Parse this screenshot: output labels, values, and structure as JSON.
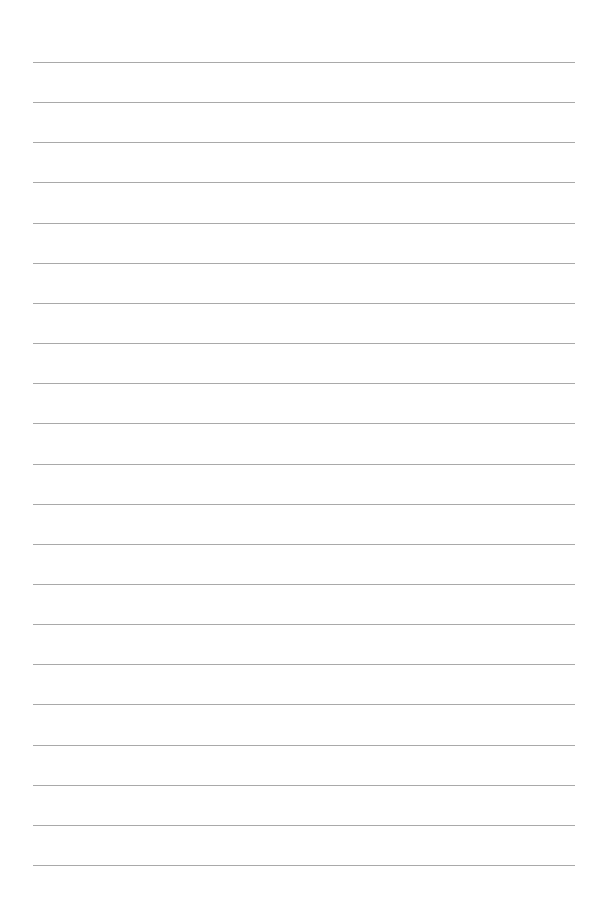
{
  "page": {
    "type": "lined-paper",
    "background_color": "#ffffff",
    "line_color": "#a9a9a9",
    "line_count": 21,
    "first_line_y": 62,
    "line_spacing": 40.15,
    "line_left_x": 33,
    "line_right_x": 575
  }
}
